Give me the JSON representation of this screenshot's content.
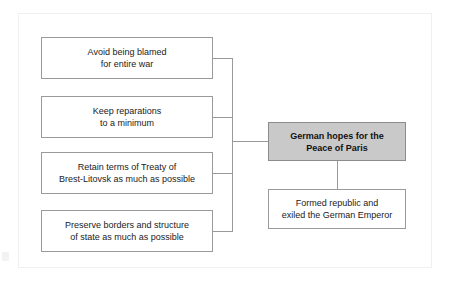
{
  "diagram": {
    "title": "German hopes for the Peace of Paris",
    "type": "bracket-cluster",
    "central_node": {
      "label": "German hopes for the\nPeace of Paris",
      "fill_color": "#c9c9c9",
      "border_color": "#8c8c8c",
      "bold": true
    },
    "left_nodes": [
      {
        "label": "Avoid being blamed\nfor entire war"
      },
      {
        "label": "Keep reparations\nto a minimum"
      },
      {
        "label": "Retain terms of Treaty of\nBrest-Litovsk as much as possible"
      },
      {
        "label": "Preserve borders and structure\nof state as much as possible"
      }
    ],
    "outcome_node": {
      "label": "Formed republic and\nexiled the German Emperor"
    },
    "colors": {
      "box_border": "#9a9a9a",
      "box_fill": "#ffffff",
      "connector": "#9a9a9a",
      "text": "#222222",
      "panel_border": "#f0f0f0",
      "background": "#ffffff"
    }
  }
}
